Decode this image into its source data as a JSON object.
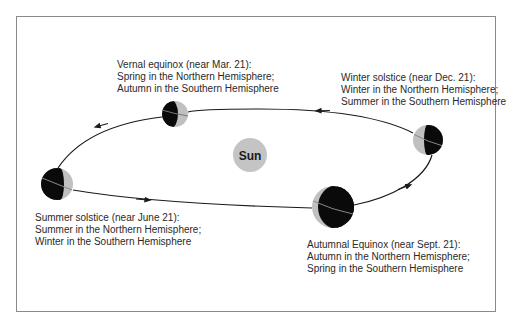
{
  "diagram": {
    "sun": {
      "label": "Sun",
      "color": "#c4c4c4"
    },
    "colors": {
      "night": "#0a0a0a",
      "day": "#c0c0c0",
      "orbit": "#1a1a1a",
      "frame": "#8a8a8a"
    },
    "positions": {
      "vernal": {
        "title": "Vernal equinox (near Mar. 21):",
        "line2": "Spring in the Northern Hemisphere;",
        "line3": "Autumn in the Southern Hemisphere"
      },
      "winter": {
        "title": "Winter solstice (near Dec. 21):",
        "line2": "Winter in the Northern Hemisphere;",
        "line3": "Summer in the Southern Hemisphere"
      },
      "summer": {
        "title": "Summer solstice (near June 21):",
        "line2": "Summer in the Northern Hemisphere;",
        "line3": "Winter in the Southern Hemisphere"
      },
      "autumnal": {
        "title": "Autumnal Equinox (near Sept. 21):",
        "line2": "Autumn in the Northern Hemisphere;",
        "line3": "Spring in the Southern Hemisphere"
      }
    },
    "orbit_direction": "counterclockwise as viewed (arrows: top leftward, bottom rightward)"
  }
}
